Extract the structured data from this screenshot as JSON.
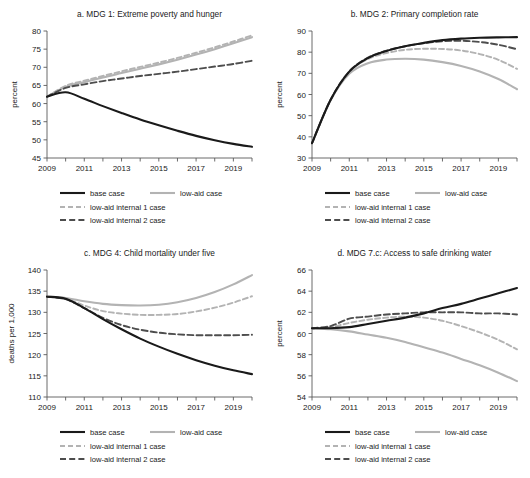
{
  "figure": {
    "background": "#ffffff",
    "width": 530,
    "height": 478
  },
  "style": {
    "base_case_color": "#1a1a1a",
    "low_aid_color": "#b3b3b3",
    "low_aid_internal_1_color": "#b3b3b3",
    "low_aid_internal_2_color": "#4d4d4d",
    "axis_color": "#5a5a5a"
  },
  "legend": {
    "items": [
      {
        "label": "base case",
        "key": "base_case",
        "color": "#1a1a1a",
        "dash": "none",
        "width": 2.1
      },
      {
        "label": "low-aid case",
        "key": "low_aid",
        "color": "#b3b3b3",
        "dash": "none",
        "width": 2.1
      },
      {
        "label": "low-aid internal 1 case",
        "key": "low_aid_internal_1",
        "color": "#b3b3b3",
        "dash": "5,3",
        "width": 1.9
      },
      {
        "label": "low-aid internal 2 case",
        "key": "low_aid_internal_2",
        "color": "#4d4d4d",
        "dash": "6,3.2",
        "width": 1.9
      }
    ]
  },
  "chart_data": [
    {
      "id": "a",
      "type": "line",
      "title": "a.  MDG 1: Extreme poverty and hunger",
      "xlabel": "",
      "ylabel": "percent",
      "xlim": [
        2009,
        2020
      ],
      "ylim": [
        45,
        80
      ],
      "yticks": [
        45,
        50,
        55,
        60,
        65,
        70,
        75,
        80
      ],
      "xticks": [
        2009,
        2010,
        2011,
        2012,
        2013,
        2014,
        2015,
        2016,
        2017,
        2018,
        2019,
        2020
      ],
      "xticklabels": [
        "2009",
        "",
        "2011",
        "",
        "2013",
        "",
        "2015",
        "",
        "2017",
        "",
        "2019",
        ""
      ],
      "grid": false,
      "legend_position": "below",
      "x": [
        2009,
        2010,
        2011,
        2012,
        2013,
        2014,
        2015,
        2016,
        2017,
        2018,
        2019,
        2020
      ],
      "series": [
        {
          "name": "base case",
          "key": "base_case",
          "values": [
            61.9,
            63.1,
            61.3,
            59.3,
            57.4,
            55.6,
            54.0,
            52.5,
            51.1,
            49.9,
            48.9,
            48.1
          ]
        },
        {
          "name": "low-aid case",
          "key": "low_aid",
          "values": [
            61.9,
            64.6,
            65.9,
            67.2,
            68.4,
            69.6,
            70.8,
            72.1,
            73.5,
            75.0,
            76.6,
            78.3
          ]
        },
        {
          "name": "low-aid internal 1 case",
          "key": "low_aid_internal_1",
          "values": [
            61.9,
            64.9,
            66.3,
            67.6,
            68.9,
            70.1,
            71.3,
            72.6,
            74.0,
            75.5,
            77.1,
            78.8
          ]
        },
        {
          "name": "low-aid internal 2 case",
          "key": "low_aid_internal_2",
          "values": [
            61.9,
            64.3,
            65.3,
            66.2,
            66.9,
            67.6,
            68.2,
            68.8,
            69.5,
            70.2,
            70.9,
            71.8
          ]
        }
      ]
    },
    {
      "id": "b",
      "type": "line",
      "title": "b.  MDG 2: Primary completion rate",
      "xlabel": "",
      "ylabel": "percent",
      "xlim": [
        2009,
        2020
      ],
      "ylim": [
        30,
        90
      ],
      "yticks": [
        30,
        40,
        50,
        60,
        70,
        80,
        90
      ],
      "xticks": [
        2009,
        2010,
        2011,
        2012,
        2013,
        2014,
        2015,
        2016,
        2017,
        2018,
        2019,
        2020
      ],
      "xticklabels": [
        "2009",
        "",
        "2011",
        "",
        "2013",
        "",
        "2015",
        "",
        "2017",
        "",
        "2019",
        ""
      ],
      "grid": false,
      "legend_position": "below",
      "x": [
        2009,
        2010,
        2011,
        2012,
        2013,
        2014,
        2015,
        2016,
        2017,
        2018,
        2019,
        2020
      ],
      "series": [
        {
          "name": "base case",
          "key": "base_case",
          "values": [
            37.0,
            57.5,
            70.8,
            77.2,
            80.6,
            82.8,
            84.4,
            85.7,
            86.4,
            86.8,
            87.0,
            87.1
          ]
        },
        {
          "name": "low-aid case",
          "key": "low_aid",
          "values": [
            37.0,
            57.3,
            69.8,
            74.8,
            76.5,
            76.9,
            76.5,
            75.3,
            73.5,
            70.9,
            67.3,
            62.5
          ]
        },
        {
          "name": "low-aid internal 1 case",
          "key": "low_aid_internal_1",
          "values": [
            37.0,
            57.5,
            70.6,
            76.8,
            79.6,
            81.1,
            81.6,
            81.5,
            80.8,
            79.1,
            76.4,
            72.1
          ]
        },
        {
          "name": "low-aid internal 2 case",
          "key": "low_aid_internal_2",
          "values": [
            37.0,
            57.5,
            70.9,
            77.4,
            80.7,
            82.8,
            84.2,
            85.2,
            85.4,
            84.8,
            83.5,
            81.4
          ]
        }
      ]
    },
    {
      "id": "c",
      "type": "line",
      "title": "c.  MDG 4: Child mortality under five",
      "xlabel": "",
      "ylabel": "deaths per 1,000",
      "xlim": [
        2009,
        2020
      ],
      "ylim": [
        110,
        140
      ],
      "yticks": [
        110,
        115,
        120,
        125,
        130,
        135,
        140
      ],
      "xticks": [
        2009,
        2010,
        2011,
        2012,
        2013,
        2014,
        2015,
        2016,
        2017,
        2018,
        2019,
        2020
      ],
      "xticklabels": [
        "2009",
        "",
        "2011",
        "",
        "2013",
        "",
        "2015",
        "",
        "2017",
        "",
        "2019",
        ""
      ],
      "grid": false,
      "legend_position": "below",
      "x": [
        2009,
        2010,
        2011,
        2012,
        2013,
        2014,
        2015,
        2016,
        2017,
        2018,
        2019,
        2020
      ],
      "series": [
        {
          "name": "base case",
          "key": "base_case",
          "values": [
            133.7,
            133.2,
            131.0,
            128.4,
            126.0,
            123.8,
            121.9,
            120.2,
            118.7,
            117.4,
            116.3,
            115.4
          ]
        },
        {
          "name": "low-aid case",
          "key": "low_aid",
          "values": [
            133.7,
            133.4,
            132.6,
            132.0,
            131.7,
            131.6,
            131.8,
            132.4,
            133.4,
            134.8,
            136.6,
            138.8
          ]
        },
        {
          "name": "low-aid internal 1 case",
          "key": "low_aid_internal_1",
          "values": [
            133.7,
            133.2,
            131.6,
            130.3,
            129.7,
            129.4,
            129.4,
            129.6,
            130.2,
            131.1,
            132.3,
            133.8
          ]
        },
        {
          "name": "low-aid internal 2 case",
          "key": "low_aid_internal_2",
          "values": [
            133.7,
            133.1,
            131.0,
            128.7,
            127.0,
            125.9,
            125.2,
            124.8,
            124.6,
            124.6,
            124.6,
            124.7
          ]
        }
      ]
    },
    {
      "id": "d",
      "type": "line",
      "title": "d.  MDG 7.c: Access to safe drinking water",
      "xlabel": "",
      "ylabel": "percent",
      "xlim": [
        2009,
        2020
      ],
      "ylim": [
        54,
        66
      ],
      "yticks": [
        54,
        56,
        58,
        60,
        62,
        64,
        66
      ],
      "xticks": [
        2009,
        2010,
        2011,
        2012,
        2013,
        2014,
        2015,
        2016,
        2017,
        2018,
        2019,
        2020
      ],
      "xticklabels": [
        "2009",
        "",
        "2011",
        "",
        "2013",
        "",
        "2015",
        "",
        "2017",
        "",
        "2019",
        ""
      ],
      "grid": false,
      "legend_position": "below",
      "x": [
        2009,
        2010,
        2011,
        2012,
        2013,
        2014,
        2015,
        2016,
        2017,
        2018,
        2019,
        2020
      ],
      "series": [
        {
          "name": "base case",
          "key": "base_case",
          "values": [
            60.5,
            60.5,
            60.6,
            60.9,
            61.2,
            61.5,
            61.9,
            62.4,
            62.8,
            63.3,
            63.8,
            64.3
          ]
        },
        {
          "name": "low-aid case",
          "key": "low_aid",
          "values": [
            60.5,
            60.4,
            60.2,
            59.9,
            59.6,
            59.2,
            58.7,
            58.2,
            57.6,
            57.0,
            56.3,
            55.5
          ]
        },
        {
          "name": "low-aid internal 1 case",
          "key": "low_aid_internal_1",
          "values": [
            60.5,
            60.6,
            61.0,
            61.3,
            61.5,
            61.6,
            61.5,
            61.2,
            60.7,
            60.1,
            59.4,
            58.5
          ]
        },
        {
          "name": "low-aid internal 2 case",
          "key": "low_aid_internal_2",
          "values": [
            60.5,
            60.7,
            61.4,
            61.6,
            61.8,
            61.9,
            62.0,
            62.0,
            62.0,
            61.9,
            61.9,
            61.8
          ]
        }
      ]
    }
  ]
}
